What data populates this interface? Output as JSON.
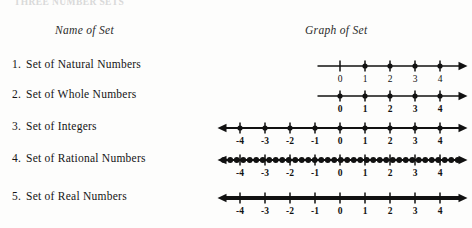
{
  "page": {
    "cut_off_header": "THREE NUMBER SETS",
    "background_color": "#fdfdfc",
    "ink_color": "#111111"
  },
  "headers": {
    "name_column": "Name of Set",
    "graph_column": "Graph of Set"
  },
  "rows": [
    {
      "number": "1.",
      "label": "Set of Natural Numbers",
      "graph": {
        "kind": "discrete-points",
        "line_start_value": -0.9,
        "line_end_value": 5.1,
        "left_arrow": false,
        "right_arrow": true,
        "ticks": [
          "0",
          "1",
          "2",
          "3",
          "4"
        ],
        "tick_values": [
          0,
          1,
          2,
          3,
          4
        ],
        "dot_values": [
          1,
          2,
          3,
          4
        ],
        "line_thickness": 1.6,
        "label_weight": "normal"
      }
    },
    {
      "number": "2.",
      "label": "Set of Whole Numbers",
      "graph": {
        "kind": "discrete-points",
        "line_start_value": -0.9,
        "line_end_value": 5.1,
        "left_arrow": false,
        "right_arrow": true,
        "ticks": [
          "0",
          "1",
          "2",
          "3",
          "4"
        ],
        "tick_values": [
          0,
          1,
          2,
          3,
          4
        ],
        "dot_values": [
          0,
          1,
          2,
          3,
          4
        ],
        "line_thickness": 1.6,
        "label_weight": "bold"
      }
    },
    {
      "number": "3.",
      "label": "Set of Integers",
      "graph": {
        "kind": "discrete-points",
        "line_start_value": -4.9,
        "line_end_value": 5.1,
        "left_arrow": true,
        "right_arrow": true,
        "ticks": [
          "-4",
          "-3",
          "-2",
          "-1",
          "0",
          "1",
          "2",
          "3",
          "4"
        ],
        "tick_values": [
          -4,
          -3,
          -2,
          -1,
          0,
          1,
          2,
          3,
          4
        ],
        "dot_values": [
          -4,
          -3,
          -2,
          -1,
          0,
          1,
          2,
          3,
          4
        ],
        "line_thickness": 1.8,
        "label_weight": "bold"
      }
    },
    {
      "number": "4.",
      "label": "Set of Rational Numbers",
      "graph": {
        "kind": "dense-points",
        "line_start_value": -4.9,
        "line_end_value": 5.1,
        "left_arrow": true,
        "right_arrow": true,
        "ticks": [
          "-4",
          "-3",
          "-2",
          "-1",
          "0",
          "1",
          "2",
          "3",
          "4"
        ],
        "tick_values": [
          -4,
          -3,
          -2,
          -1,
          0,
          1,
          2,
          3,
          4
        ],
        "dot_spacing_value": 0.26,
        "line_thickness": 1.8,
        "label_weight": "bold"
      }
    },
    {
      "number": "5.",
      "label": "Set of Real Numbers",
      "graph": {
        "kind": "solid-line",
        "line_start_value": -4.9,
        "line_end_value": 5.1,
        "left_arrow": true,
        "right_arrow": true,
        "ticks": [
          "-4",
          "-3",
          "-2",
          "-1",
          "0",
          "1",
          "2",
          "3",
          "4"
        ],
        "tick_values": [
          -4,
          -3,
          -2,
          -1,
          0,
          1,
          2,
          3,
          4
        ],
        "line_thickness": 4.2,
        "label_weight": "bold"
      }
    }
  ],
  "axis": {
    "origin_x_px": 340,
    "unit_px": 25,
    "row_tops_px": [
      58,
      88,
      120,
      152,
      190
    ],
    "label_tops_px": [
      60,
      90,
      122,
      154,
      192
    ]
  }
}
